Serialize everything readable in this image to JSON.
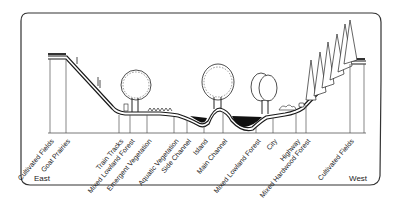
{
  "diagram": {
    "type": "river floodplain cross-section",
    "directions": {
      "left": "East",
      "right": "West"
    },
    "zones": [
      {
        "label": "Cultivated Fields",
        "x": 50
      },
      {
        "label": "Goat Prairies",
        "x": 66
      },
      {
        "label": "Train Tracks",
        "x": 119
      },
      {
        "label": "Mixed Lowland Forest",
        "x": 130
      },
      {
        "label": "Emergent Vegetation",
        "x": 147
      },
      {
        "label": "Aquatic Vegetation",
        "x": 174
      },
      {
        "label": "Side Channel",
        "x": 187
      },
      {
        "label": "Island",
        "x": 204
      },
      {
        "label": "Main Channel",
        "x": 223
      },
      {
        "label": "Mixed Lowland Forest",
        "x": 256
      },
      {
        "label": "City",
        "x": 275
      },
      {
        "label": "Highway",
        "x": 296
      },
      {
        "label": "Mixed Hardwood Forest",
        "x": 306
      },
      {
        "label": "Cultivated Fields",
        "x": 350
      }
    ],
    "colors": {
      "line": "#1a1a1a",
      "water": "#111111",
      "frame": "#333333",
      "background": "#ffffff"
    }
  }
}
